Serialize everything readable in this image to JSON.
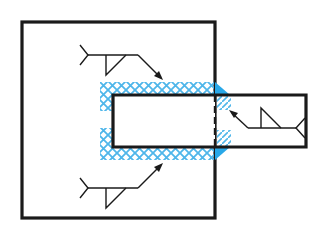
{
  "diagram": {
    "title": "Fillet weld around bar inserted through plate",
    "colors": {
      "outline": "#1a1a1a",
      "weld_fill": "#29a8e8",
      "weld_hatch": "#4fb6ea",
      "background": "#ffffff"
    },
    "plate": {
      "x": 22,
      "y": 22,
      "width": 193,
      "height": 196
    },
    "bar": {
      "x": 113,
      "y": 95,
      "width": 193,
      "height": 52
    },
    "hidden_edge": {
      "x": 215,
      "y1": 95,
      "y2": 147,
      "style": "dashed"
    },
    "weld_symbols": [
      {
        "id": "top",
        "type": "fillet",
        "tail_x": 78,
        "tail_y": 48,
        "ref_end_x": 138,
        "arrow_tip_x": 163,
        "arrow_tip_y": 80,
        "side": "arrow"
      },
      {
        "id": "bottom",
        "type": "fillet",
        "tail_x": 78,
        "tail_y": 188,
        "ref_end_x": 138,
        "arrow_tip_x": 163,
        "arrow_tip_y": 163,
        "side": "arrow"
      },
      {
        "id": "right",
        "type": "fillet",
        "tail_x": 306,
        "tail_y": 128,
        "ref_end_x": 246,
        "arrow_tip_x": 228,
        "arrow_tip_y": 110,
        "side": "arrow"
      }
    ],
    "labels": []
  }
}
